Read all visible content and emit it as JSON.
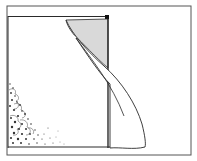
{
  "illustration": {
    "subject": "curtain-window-line-drawing",
    "colors": {
      "background": "#ffffff",
      "line": "#2a2a2a",
      "curtain_shade": "#d9d9d9",
      "foliage": "#333333"
    }
  }
}
